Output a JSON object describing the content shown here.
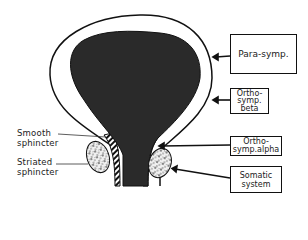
{
  "diagram": {
    "type": "anatomical-schematic",
    "left_labels": [
      {
        "id": "smooth-sphincter",
        "text": "Smooth\nsphincter"
      },
      {
        "id": "striated-sphincter",
        "text": "Striated\nsphincter"
      }
    ],
    "right_boxes": [
      {
        "id": "para-symp",
        "text": "Para-symp.",
        "target": "bladder wall (detrusor)"
      },
      {
        "id": "ortho-symp-beta",
        "text": "Ortho-\nsymp.\nbeta",
        "target": "bladder wall"
      },
      {
        "id": "ortho-symp-alpha",
        "text": "Ortho-\nsymp.alpha",
        "target": "smooth sphincter"
      },
      {
        "id": "somatic-system",
        "text": "Somatic\nsystem",
        "target": "striated sphincter"
      }
    ],
    "colors": {
      "bladder_fill": "#2a2a2a",
      "outline": "#111111",
      "background": "#ffffff"
    }
  }
}
